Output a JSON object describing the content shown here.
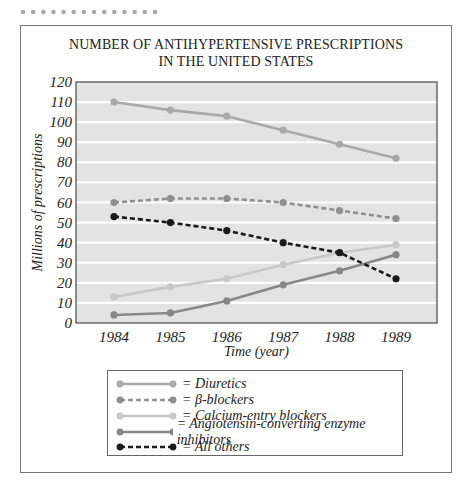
{
  "decoration": {
    "dot_count": 14,
    "dot_color": "#a8a8a8"
  },
  "chart_data": {
    "type": "line",
    "title_lines": [
      "NUMBER OF ANTIHYPERTENSIVE PRESCRIPTIONS",
      "IN THE UNITED STATES"
    ],
    "xlabel": "Time (year)",
    "ylabel": "Millions of prescriptions",
    "x": [
      "1984",
      "1985",
      "1986",
      "1987",
      "1988",
      "1989"
    ],
    "ylim": [
      0,
      120
    ],
    "yticks": [
      0,
      10,
      20,
      30,
      40,
      50,
      60,
      70,
      80,
      90,
      100,
      110,
      120
    ],
    "grid": true,
    "background": "#e3e3e3",
    "legend_position": "bottom",
    "series": [
      {
        "name": "Diuretics",
        "label": "= Diuretics",
        "values": [
          110,
          106,
          103,
          96,
          89,
          82
        ],
        "color": "#a9a9a9",
        "dash": false
      },
      {
        "name": "β-blockers",
        "label": "= β-blockers",
        "values": [
          60,
          62,
          62,
          60,
          56,
          52
        ],
        "color": "#8f8f8f",
        "dash": true
      },
      {
        "name": "Calcium-entry blockers",
        "label": "= Calcium-entry blockers",
        "values": [
          13,
          18,
          22,
          29,
          35,
          39
        ],
        "color": "#c8c8c8",
        "dash": false
      },
      {
        "name": "Angiotensin-converting enzyme inhibitors",
        "label": "= Angiotensin-converting enzyme inhibitors",
        "values": [
          4,
          5,
          11,
          19,
          26,
          34
        ],
        "color": "#888888",
        "dash": false
      },
      {
        "name": "All others",
        "label": "= All others",
        "values": [
          53,
          50,
          46,
          40,
          35,
          22
        ],
        "color": "#1a1a1a",
        "dash": true
      }
    ]
  }
}
